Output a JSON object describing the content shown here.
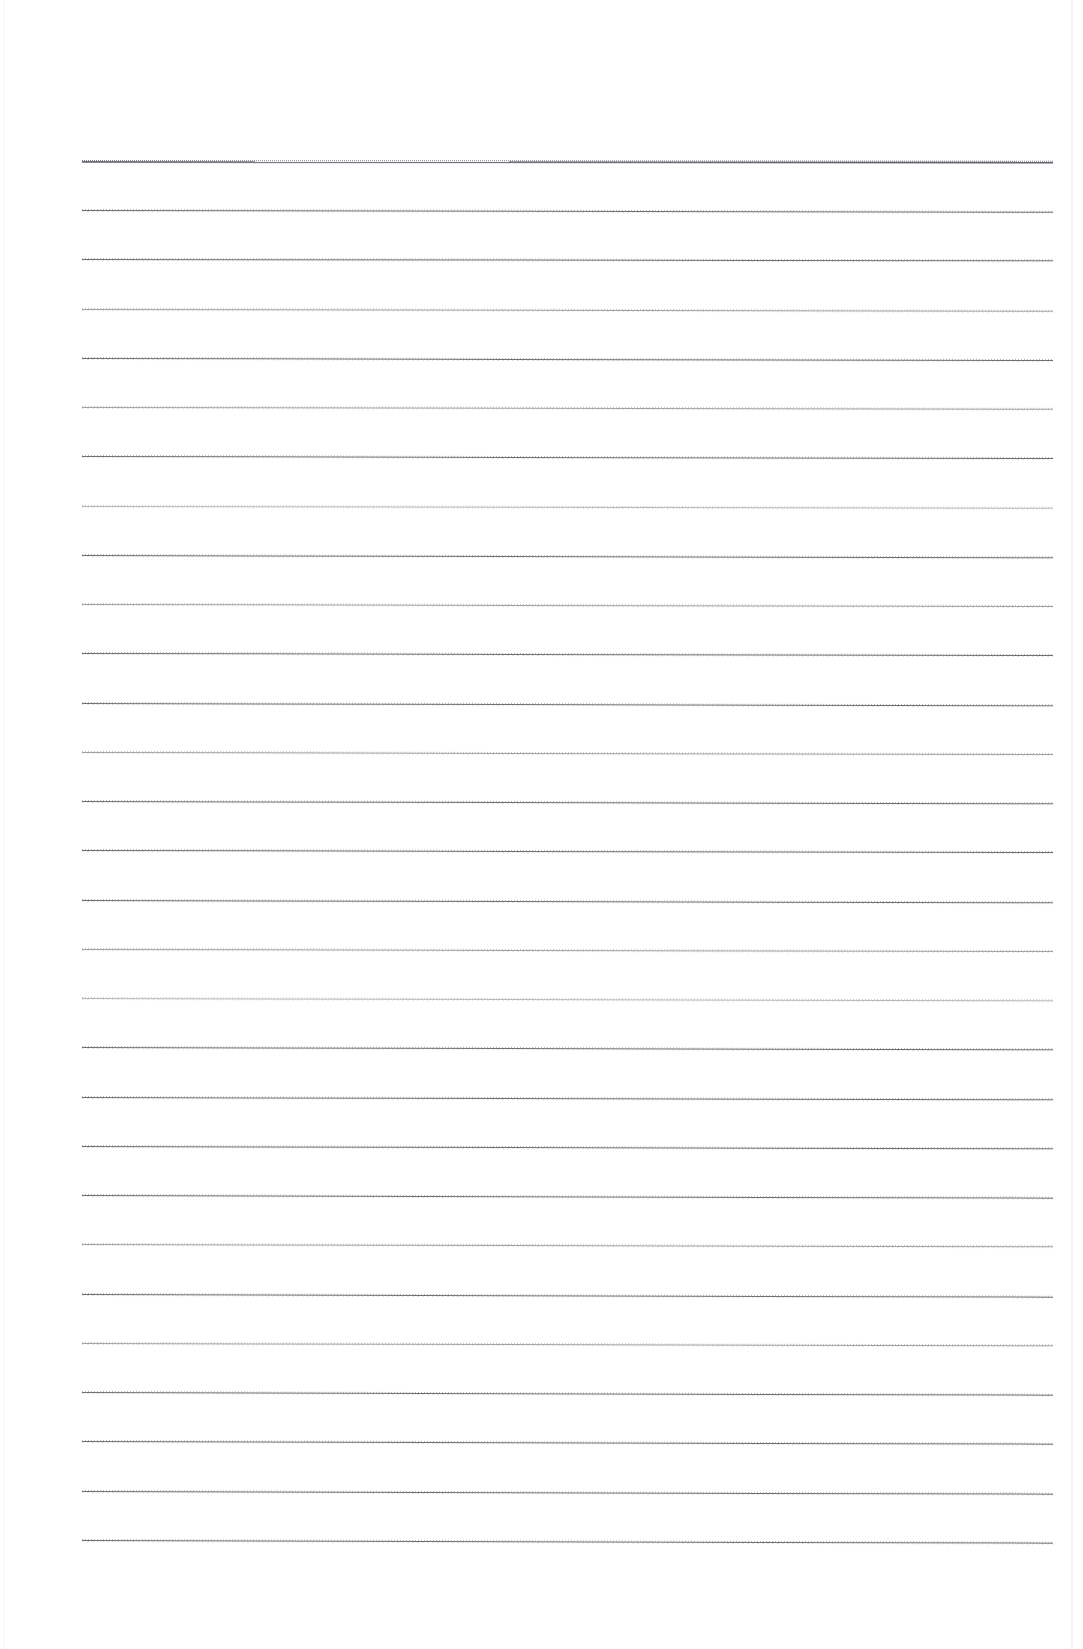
{
  "document": {
    "kind": "scanned-page",
    "page_type": "blank-ruled-notebook-page",
    "description": "Scanned blank lined paper with horizontal ruled lines and no handwriting or printed text",
    "has_text": false,
    "text_content": "",
    "orientation": "portrait",
    "page_width_px": 1083,
    "page_height_px": 1649,
    "background_color": "#ffffff",
    "rule_color": "#6f7076",
    "rule_color_light": "#8d8e95",
    "rule_color_faint": "#9a9ba2",
    "heavy_rule_color": "#5f6067",
    "scan_edge_color": "#e0e0e4"
  },
  "ruling": {
    "line_count": 29,
    "first_line_y": 161,
    "last_line_y": 1540,
    "line_spacing_px": 49.25,
    "line_left_x": 82,
    "line_right_x": 1053,
    "line_width_px": 971,
    "line_thickness_px": 1,
    "skew_degrees": 0.12,
    "lines": [
      {
        "index": 1,
        "y": 161,
        "left": 82,
        "width": 971,
        "weight": "heavy",
        "skew": 0.05
      },
      {
        "index": 2,
        "y": 210,
        "left": 82,
        "width": 971,
        "weight": "normal",
        "skew": 0.1
      },
      {
        "index": 3,
        "y": 259,
        "left": 82,
        "width": 971,
        "weight": "normal",
        "skew": 0.08
      },
      {
        "index": 4,
        "y": 309,
        "left": 82,
        "width": 971,
        "weight": "light",
        "skew": 0.1
      },
      {
        "index": 5,
        "y": 358,
        "left": 82,
        "width": 971,
        "weight": "normal",
        "skew": 0.12
      },
      {
        "index": 6,
        "y": 407,
        "left": 82,
        "width": 971,
        "weight": "light",
        "skew": 0.1
      },
      {
        "index": 7,
        "y": 456,
        "left": 82,
        "width": 971,
        "weight": "normal",
        "skew": 0.12
      },
      {
        "index": 8,
        "y": 506,
        "left": 82,
        "width": 971,
        "weight": "faint",
        "skew": 0.1
      },
      {
        "index": 9,
        "y": 555,
        "left": 82,
        "width": 971,
        "weight": "normal",
        "skew": 0.14
      },
      {
        "index": 10,
        "y": 604,
        "left": 82,
        "width": 971,
        "weight": "light",
        "skew": 0.12
      },
      {
        "index": 11,
        "y": 653,
        "left": 82,
        "width": 971,
        "weight": "normal",
        "skew": 0.12
      },
      {
        "index": 12,
        "y": 703,
        "left": 82,
        "width": 971,
        "weight": "normal",
        "skew": 0.14
      },
      {
        "index": 13,
        "y": 752,
        "left": 82,
        "width": 971,
        "weight": "light",
        "skew": 0.12
      },
      {
        "index": 14,
        "y": 801,
        "left": 82,
        "width": 971,
        "weight": "normal",
        "skew": 0.14
      },
      {
        "index": 15,
        "y": 850,
        "left": 82,
        "width": 971,
        "weight": "normal",
        "skew": 0.12
      },
      {
        "index": 16,
        "y": 900,
        "left": 82,
        "width": 971,
        "weight": "normal",
        "skew": 0.14
      },
      {
        "index": 17,
        "y": 949,
        "left": 82,
        "width": 971,
        "weight": "light",
        "skew": 0.12
      },
      {
        "index": 18,
        "y": 998,
        "left": 82,
        "width": 971,
        "weight": "faint",
        "skew": 0.14
      },
      {
        "index": 19,
        "y": 1047,
        "left": 82,
        "width": 971,
        "weight": "normal",
        "skew": 0.14
      },
      {
        "index": 20,
        "y": 1097,
        "left": 82,
        "width": 971,
        "weight": "normal",
        "skew": 0.14
      },
      {
        "index": 21,
        "y": 1146,
        "left": 82,
        "width": 971,
        "weight": "normal",
        "skew": 0.14
      },
      {
        "index": 22,
        "y": 1195,
        "left": 82,
        "width": 971,
        "weight": "normal",
        "skew": 0.16
      },
      {
        "index": 23,
        "y": 1244,
        "left": 82,
        "width": 971,
        "weight": "light",
        "skew": 0.14
      },
      {
        "index": 24,
        "y": 1294,
        "left": 82,
        "width": 971,
        "weight": "normal",
        "skew": 0.16
      },
      {
        "index": 25,
        "y": 1343,
        "left": 82,
        "width": 971,
        "weight": "light",
        "skew": 0.14
      },
      {
        "index": 26,
        "y": 1392,
        "left": 82,
        "width": 971,
        "weight": "normal",
        "skew": 0.16
      },
      {
        "index": 27,
        "y": 1441,
        "left": 82,
        "width": 971,
        "weight": "normal",
        "skew": 0.16
      },
      {
        "index": 28,
        "y": 1491,
        "left": 82,
        "width": 971,
        "weight": "normal",
        "skew": 0.16
      },
      {
        "index": 29,
        "y": 1540,
        "left": 82,
        "width": 971,
        "weight": "normal",
        "skew": 0.16
      }
    ]
  },
  "margins": {
    "top_px": 161,
    "bottom_px": 109,
    "left_px": 82,
    "right_px": 30
  },
  "artifacts": {
    "right_scan_edge_x": 1071,
    "left_scan_edge_x": 3,
    "vignette": true
  }
}
